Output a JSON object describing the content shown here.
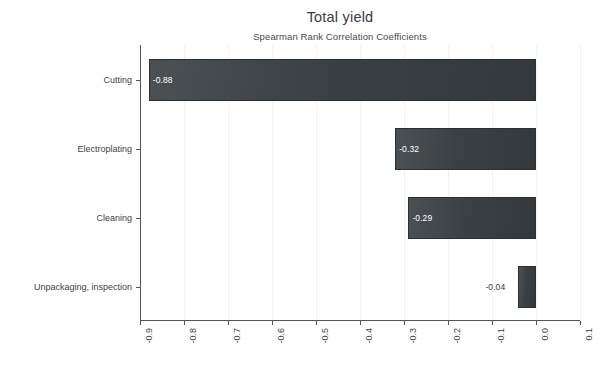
{
  "chart_data": {
    "type": "bar",
    "orientation": "horizontal",
    "title": "Total yield",
    "subtitle": "Spearman Rank Correlation Coefficients",
    "xlabel": "",
    "ylabel": "",
    "categories": [
      "Cutting",
      "Electroplating",
      "Cleaning",
      "Unpackaging, inspection"
    ],
    "values": [
      -0.88,
      -0.32,
      -0.29,
      -0.04
    ],
    "value_labels": [
      "-0.88",
      "-0.32",
      "-0.29",
      "-0.04"
    ],
    "xlim": [
      -0.9,
      0.1
    ],
    "xticks": [
      -0.9,
      -0.8,
      -0.7,
      -0.6,
      -0.5,
      -0.4,
      -0.3,
      -0.2,
      -0.1,
      0.0,
      0.1
    ],
    "xtick_labels": [
      "-0.9",
      "-0.8",
      "-0.7",
      "-0.6",
      "-0.5",
      "-0.4",
      "-0.3",
      "-0.2",
      "-0.1",
      "0.0",
      "0.1"
    ],
    "xtick_rotation": 90,
    "grid": true,
    "grid_axis": "x",
    "legend": false,
    "bar_color": "#3b4045",
    "bar_edge_color": "#2b3035",
    "label_color": "#ffffff",
    "background_color": "#ffffff",
    "axis_color": "#555555"
  }
}
